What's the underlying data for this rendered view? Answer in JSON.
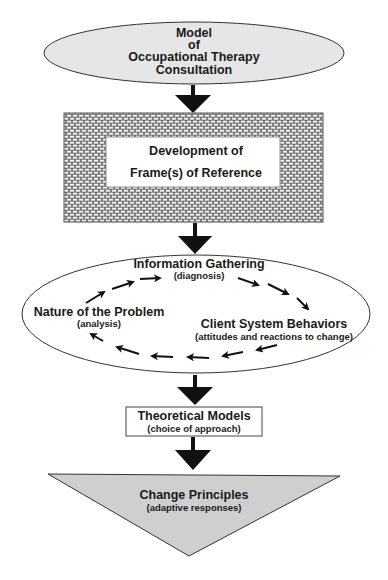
{
  "diagram": {
    "title_node": {
      "lines": [
        "Model",
        "of",
        "Occupational Therapy",
        "Consultation"
      ],
      "shape": "ellipse",
      "fill": "#e6e6e6"
    },
    "frame_node": {
      "lines": [
        "Development of",
        "Frame(s) of Reference"
      ],
      "shape": "brick-rectangle"
    },
    "cycle": {
      "shape": "ellipse",
      "nodes": [
        {
          "label": "Information Gathering",
          "sub": "(diagnosis)"
        },
        {
          "label": "Client System Behaviors",
          "sub": "(attitudes and reactions to change)"
        },
        {
          "label": "Nature of the Problem",
          "sub": "(analysis)"
        }
      ],
      "direction": "clockwise"
    },
    "models_node": {
      "label": "Theoretical Models",
      "sub": "(choice of approach)",
      "shape": "rectangle"
    },
    "principles_node": {
      "label": "Change Principles",
      "sub": "(adaptive responses)",
      "shape": "inverted-triangle",
      "fill": "#cfcfcf"
    },
    "edges": [
      {
        "from": "title_node",
        "to": "frame_node"
      },
      {
        "from": "frame_node",
        "to": "cycle"
      },
      {
        "from": "cycle",
        "to": "models_node"
      },
      {
        "from": "models_node",
        "to": "principles_node"
      }
    ]
  }
}
